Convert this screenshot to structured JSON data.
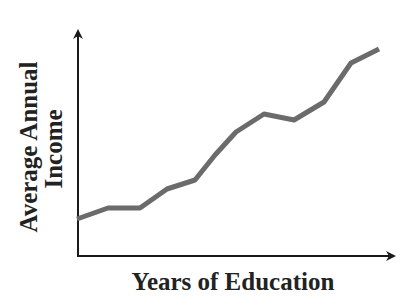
{
  "chart_data": {
    "type": "line",
    "title": "",
    "xlabel": "Years of Education",
    "ylabel": [
      "Average Annual",
      "Income"
    ],
    "x_ticks": [],
    "y_ticks": [],
    "grid": false,
    "legend": null,
    "series": [
      {
        "name": "Average Annual Income",
        "x": [
          0,
          1,
          2,
          3,
          4,
          5,
          6,
          7,
          8,
          9,
          10,
          11
        ],
        "values": [
          0.2,
          0.26,
          0.26,
          0.37,
          0.42,
          0.56,
          0.7,
          0.8,
          0.77,
          0.87,
          1.08,
          1.16
        ],
        "pixels": [
          [
            77,
            219
          ],
          [
            108,
            208
          ],
          [
            140,
            208
          ],
          [
            167,
            189
          ],
          [
            195,
            180
          ],
          [
            215,
            155
          ],
          [
            236,
            132
          ],
          [
            264,
            114
          ],
          [
            294,
            120
          ],
          [
            324,
            102
          ],
          [
            351,
            63
          ],
          [
            379,
            49
          ]
        ]
      }
    ],
    "colors": {
      "line": "#6b6b6b",
      "axis": "#1a1a1a",
      "text": "#222222"
    }
  }
}
